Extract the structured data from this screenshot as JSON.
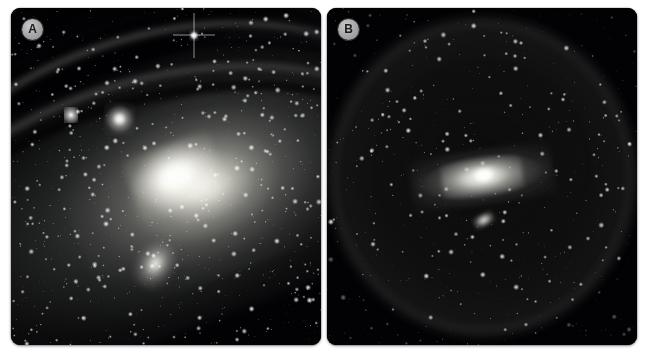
{
  "figure": {
    "background_color": "#ffffff",
    "panel_count": 2,
    "layout": "side-by-side"
  },
  "panels": [
    {
      "id": "panel-a",
      "label": "A",
      "subject": "Andromeda Galaxy close-up core and dust lanes",
      "features": [
        "bright elliptical galactic bulge",
        "dark spiral dust lanes",
        "bright companion knot upper-left of core",
        "elliptical satellite galaxy lower-centre",
        "dense star field"
      ],
      "background_color": "#020204",
      "badge_color": "#a9a9a9",
      "badge_text_color": "#1c1c1c"
    },
    {
      "id": "panel-b",
      "label": "B",
      "subject": "Andromeda Galaxy wide field inside a large diffuse halo",
      "features": [
        "large circular diffuse halo",
        "small inclined spiral galaxy at centre",
        "small companion galaxy below the disc",
        "sparse star field"
      ],
      "background_color": "#010103",
      "badge_color": "#a9a9a9",
      "badge_text_color": "#1c1c1c"
    }
  ]
}
